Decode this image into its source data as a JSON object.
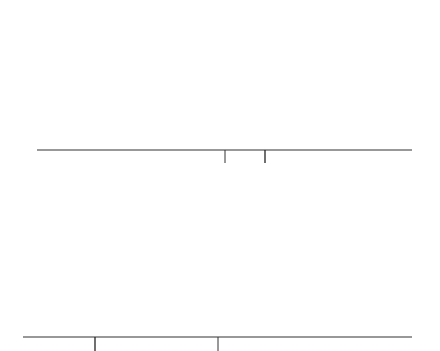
{
  "chart_data": [
    {
      "type": "area",
      "title": "",
      "description": "Standard normal curve, area shaded to the left of z = 0.93",
      "xlabel": "z",
      "ylabel": "",
      "tick_labels": [
        "0",
        "0.93"
      ],
      "ticks": [
        0,
        0.93
      ],
      "shaded_region": {
        "from": "-inf",
        "to": 0.93
      },
      "xlim": [
        -3.5,
        3.5
      ],
      "grid": false
    },
    {
      "type": "area",
      "title": "",
      "description": "Standard normal curve, area shaded to the right of a negative z cutoff",
      "xlabel": "z",
      "ylabel": "",
      "tick_labels": [],
      "ticks": [
        -1.16,
        0
      ],
      "shaded_region": {
        "from": -1.16,
        "to": "+inf"
      },
      "xlim": [
        -3.5,
        3.5
      ],
      "grid": false
    }
  ],
  "colors": {
    "shade": "#b4b4b4",
    "curve": "#1a1a1a",
    "axis": "#333333"
  },
  "labels": {
    "top_tick_0": "0",
    "top_tick_1": "0.93",
    "top_axis": "z",
    "bottom_axis": "z"
  }
}
